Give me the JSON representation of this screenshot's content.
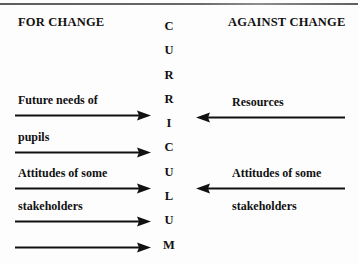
{
  "diagram": {
    "title_left": "FOR CHANGE",
    "title_right": "AGAINST CHANGE",
    "spine_word": "CURRICULUM",
    "spine_letters": [
      "C",
      "U",
      "R",
      "R",
      "I",
      "C",
      "U",
      "L",
      "U",
      "M"
    ],
    "colors": {
      "ink": "#111111",
      "background": "#fdfdfd",
      "rule": "#5d5d5d"
    },
    "left_labels": [
      "Future needs of",
      "pupils",
      "Attitudes of some",
      "stakeholders"
    ],
    "right_labels": [
      "Resources",
      "Attitudes of some",
      "stakeholders"
    ],
    "arrows": {
      "left_direction": "right",
      "right_direction": "left",
      "left_count": 5,
      "right_count": 2
    }
  }
}
